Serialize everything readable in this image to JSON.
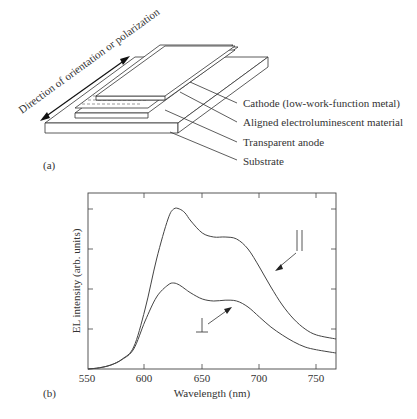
{
  "panel_a": {
    "label": "(a)",
    "direction_label": "Direction of orientation or polarization",
    "layers": [
      {
        "name": "cathode",
        "label": "Cathode (low-work-function metal)"
      },
      {
        "name": "emitter",
        "label": "Aligned electroluminescent material"
      },
      {
        "name": "anode",
        "label": "Transparent anode"
      },
      {
        "name": "substrate",
        "label": "Substrate"
      }
    ]
  },
  "panel_b": {
    "label": "(b)",
    "parallel_symbol": "||",
    "perpendicular_symbol": "⊥"
  },
  "chart_data": {
    "type": "line",
    "title": "",
    "xlabel": "Wavelength (nm)",
    "ylabel": "EL intensity (arb. units)",
    "xlim": [
      550,
      767
    ],
    "ylim": [
      0,
      4.4
    ],
    "xticks": [
      550,
      600,
      650,
      700,
      750
    ],
    "yticks_unlabeled": [
      1,
      2,
      3,
      4
    ],
    "grid": false,
    "legend": "inline annotations with arrows",
    "series": [
      {
        "name": "parallel (||)",
        "x": [
          550,
          560,
          570,
          580,
          590,
          600,
          610,
          620,
          625,
          630,
          635,
          640,
          650,
          660,
          670,
          680,
          690,
          700,
          710,
          720,
          730,
          740,
          750,
          767
        ],
        "y": [
          0.0,
          0.03,
          0.1,
          0.25,
          0.55,
          1.5,
          2.75,
          3.75,
          4.0,
          4.0,
          3.9,
          3.7,
          3.4,
          3.3,
          3.3,
          3.25,
          3.0,
          2.55,
          2.05,
          1.6,
          1.25,
          1.0,
          0.85,
          0.75
        ]
      },
      {
        "name": "perpendicular (⊥)",
        "x": [
          550,
          560,
          570,
          580,
          590,
          600,
          610,
          620,
          625,
          630,
          635,
          640,
          650,
          660,
          670,
          680,
          690,
          700,
          710,
          720,
          730,
          740,
          750,
          767
        ],
        "y": [
          0.0,
          0.03,
          0.1,
          0.24,
          0.5,
          1.2,
          1.8,
          2.1,
          2.15,
          2.1,
          2.0,
          1.9,
          1.75,
          1.7,
          1.72,
          1.7,
          1.55,
          1.3,
          1.05,
          0.85,
          0.68,
          0.55,
          0.48,
          0.4
        ]
      }
    ]
  }
}
